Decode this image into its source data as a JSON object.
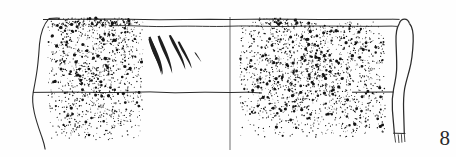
{
  "figure": {
    "label": "8",
    "caption_number": "8",
    "type": "archaeological-pottery-profile-drawing",
    "background_color": "#fefefe",
    "ink_color": "#1f1f1f",
    "line_color": "#2b2b2b",
    "stipple_color": "#141414",
    "canvas": {
      "width": 456,
      "height": 157
    }
  },
  "drawing": {
    "rim_line": {
      "name": "rim-line",
      "y": 19,
      "x_start": 43,
      "x_end": 392
    },
    "secondary_rim_line": {
      "name": "secondary-rim-line",
      "y": 26,
      "x_start": 112,
      "x_end": 392
    },
    "mid_band_line": {
      "name": "mid-band-line",
      "y": 92,
      "x_start": 33,
      "x_end": 392
    },
    "center_axis": {
      "name": "vertical-center-axis",
      "x": 230,
      "y_start": 17,
      "y_end": 150
    },
    "left_profile": {
      "name": "left-edge-profile",
      "description": "curved left break edge of sherd running from rim down past base"
    },
    "section_profile": {
      "name": "right-section-profile",
      "description": "vessel wall cross-section in solid outline at right margin",
      "x_center": 404
    },
    "decoration": {
      "name": "incised-strokes",
      "count": 5,
      "description": "three tall hooked incised strokes plus two short tick marks",
      "region": {
        "x": 145,
        "y": 33,
        "width": 62,
        "height": 48
      }
    },
    "stipple_regions": [
      {
        "name": "left-stipple-field",
        "x": 48,
        "y": 22,
        "width": 95,
        "height": 118,
        "density": 0.3,
        "description": "stippled surface texture on left portion of sherd"
      },
      {
        "name": "right-stipple-field",
        "x": 240,
        "y": 22,
        "width": 145,
        "height": 115,
        "density": 0.32,
        "description": "stippled surface texture on right portion of sherd"
      },
      {
        "name": "rim-dark-band",
        "x": 50,
        "y": 18,
        "width": 90,
        "height": 10,
        "density": 0.62,
        "description": "dark slip band along the rim top-left"
      },
      {
        "name": "rim-dark-band-right",
        "x": 258,
        "y": 18,
        "width": 40,
        "height": 9,
        "density": 0.55,
        "description": "dark slip remnant along rim at right of axis"
      }
    ]
  }
}
